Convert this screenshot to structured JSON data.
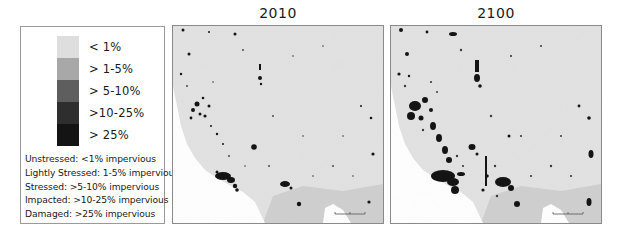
{
  "legend": {
    "classes": [
      {
        "label": "< 1%",
        "color": "#dedede"
      },
      {
        "label": "> 1-5%",
        "color": "#a8a8a8"
      },
      {
        "label": "> 5-10%",
        "color": "#5e5e5e"
      },
      {
        "label": ">10-25%",
        "color": "#2e2e2e"
      },
      {
        "label": "> 25%",
        "color": "#141414"
      }
    ],
    "definitions": [
      "Unstressed: <1% impervious",
      "Lightly Stressed: 1-5% impervious",
      "Stressed: >5-10% impervious",
      "Impacted: >10-25% impervious",
      "Damaged: >25% impervious"
    ]
  },
  "maps": [
    {
      "title": "2010",
      "scenario": "current"
    },
    {
      "title": "2100",
      "scenario": "projected"
    }
  ],
  "colors": {
    "land": "#e2e2e2",
    "land_south": "#cfcfcf",
    "ocean": "#ffffff",
    "urban_dark": "#141414",
    "urban_mid": "#3a3a3a",
    "border": "#8a8a8a"
  }
}
